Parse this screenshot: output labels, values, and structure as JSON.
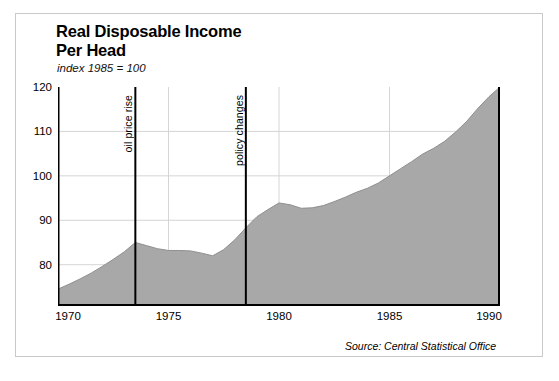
{
  "figure": {
    "title": "Real Disposable Income\nPer Head",
    "subtitle": "index 1985 = 100",
    "source": "Source: Central Statistical Office"
  },
  "colors": {
    "area_fill": "#a8a8a8",
    "area_line": "#8f8f8f",
    "axis": "#000000",
    "gridline": "#d5d5d5",
    "frame": "#c9c9c9",
    "annotation_line": "#000000"
  },
  "chart_data": {
    "type": "area",
    "title": "Real Disposable Income Per Head",
    "subtitle": "index 1985 = 100",
    "xlabel": "",
    "ylabel": "index 1985 = 100",
    "xlim": [
      1970,
      1990
    ],
    "ylim": [
      70.7,
      120
    ],
    "xticks": [
      1970,
      1975,
      1980,
      1985,
      1990
    ],
    "yticks": [
      80,
      90,
      100,
      110,
      120
    ],
    "grid": true,
    "legend": false,
    "source": "Source: Central Statistical Office",
    "series": [
      {
        "name": "Real disposable income per head",
        "x": [
          1970,
          1970.5,
          1971,
          1971.5,
          1972,
          1972.5,
          1973,
          1973.5,
          1974,
          1974.5,
          1975,
          1975.5,
          1976,
          1976.5,
          1977,
          1977.5,
          1978,
          1978.5,
          1979,
          1979.5,
          1980,
          1980.5,
          1981,
          1981.5,
          1982,
          1982.5,
          1983,
          1983.5,
          1984,
          1984.5,
          1985,
          1985.5,
          1986,
          1986.5,
          1987,
          1987.5,
          1988,
          1988.5,
          1989,
          1989.5,
          1990
        ],
        "y": [
          74.5,
          75.6,
          76.8,
          78.1,
          79.6,
          81.2,
          82.9,
          85.0,
          84.3,
          83.6,
          83.2,
          83.2,
          83.1,
          82.6,
          82.0,
          83.4,
          85.6,
          88.3,
          90.8,
          92.4,
          93.9,
          93.5,
          92.7,
          92.8,
          93.3,
          94.2,
          95.2,
          96.3,
          97.2,
          98.4,
          100.0,
          101.6,
          103.2,
          104.9,
          106.2,
          107.8,
          109.9,
          112.3,
          115.2,
          117.8,
          120.0
        ]
      }
    ],
    "annotations": [
      {
        "label": "oil price rise",
        "x": 1973.5,
        "orientation": "vertical"
      },
      {
        "label": "policy changes",
        "x": 1978.5,
        "orientation": "vertical"
      }
    ]
  }
}
